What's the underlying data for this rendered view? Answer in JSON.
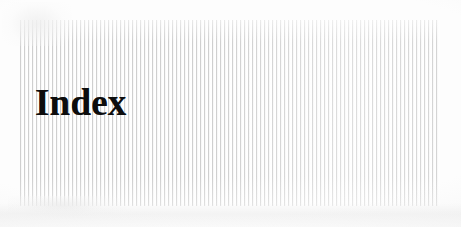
{
  "page": {
    "kind": "scanned-book-page",
    "background_color": "#fdfdfd",
    "width": 461,
    "height": 227
  },
  "banner": {
    "name": "striped-banner",
    "pattern": "vertical-stripes",
    "stripe_color": "#cfcfcf",
    "stripe_gap_color": "#ffffff",
    "stripe_period_px": 4,
    "left": 20,
    "top": 20,
    "width": 420,
    "height": 186
  },
  "heading": {
    "text": "Index",
    "color": "#0d0d0d",
    "style": "bold-serif",
    "font_size_px": 37,
    "left": 35,
    "top": 83
  }
}
